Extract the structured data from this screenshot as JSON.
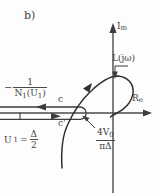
{
  "figure": {
    "panel_label": "b)",
    "type": "nyquist-describing-function-plot",
    "axes": {
      "imaginary": {
        "text": "I",
        "subscript": "m"
      },
      "real": {
        "text": "R",
        "subscript": "e"
      }
    },
    "annotations": {
      "transfer_function": "L(jω)",
      "contour_c": "c",
      "contour_c_prime": "c'",
      "negative_inverse_df": {
        "minus": "−",
        "numerator": "1",
        "denominator": "N",
        "denominator_sub": "1",
        "denominator_arg_open": "(U",
        "denominator_arg_sub": "1",
        "denominator_arg_close": ")"
      },
      "amplitude_condition": {
        "symbol": "U",
        "subscript": "1",
        "equals": "=",
        "numerator": "Δ",
        "denominator": "2"
      },
      "critical_value": {
        "numerator": "4V",
        "numerator_sub": "0",
        "denominator": "πΔ"
      }
    },
    "colors": {
      "ink": "#3d3d3d",
      "background": "#fdfdfd",
      "axis": "#4a4a4a"
    }
  }
}
